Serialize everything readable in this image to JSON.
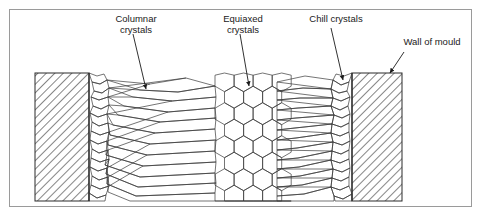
{
  "figure": {
    "background_color": "#ffffff",
    "frame_color": "#9a9a9a",
    "line_color": "#3a3a3a"
  },
  "labels": [
    {
      "id": "columnar",
      "name": "columnar-crystals-label",
      "line1": "Columnar",
      "line2": "crystals",
      "x": 136,
      "y": 22
    },
    {
      "id": "equiaxed",
      "name": "equiaxed-crystals-label",
      "line1": "Equiaxed",
      "line2": "crystals",
      "x": 243,
      "y": 22
    },
    {
      "id": "chill",
      "name": "chill-crystals-label",
      "line1": "Chill crystals",
      "line2": "",
      "x": 336,
      "y": 22
    },
    {
      "id": "wall",
      "name": "wall-of-mould-label",
      "line1": "Wall of mould",
      "line2": "",
      "x": 432,
      "y": 45
    }
  ],
  "leaders": [
    {
      "name": "columnar-leader-arrow",
      "x1": 133,
      "y1": 34,
      "x2": 146,
      "y2": 89
    },
    {
      "name": "equiaxed-leader-arrow",
      "x1": 240,
      "y1": 34,
      "x2": 249,
      "y2": 86
    },
    {
      "name": "chill-leader-arrow",
      "x1": 331,
      "y1": 28,
      "x2": 343,
      "y2": 80
    },
    {
      "name": "wall-leader-arrow",
      "x1": 404,
      "y1": 52,
      "x2": 390,
      "y2": 73
    }
  ],
  "zones": {
    "left_wall": {
      "name": "left-mould-wall",
      "x": 35,
      "y": 73,
      "width": 54,
      "height": 128,
      "hatch": "diagonal-45"
    },
    "right_wall": {
      "name": "right-mould-wall",
      "x": 352,
      "y": 73,
      "width": 50,
      "height": 128,
      "hatch": "diagonal-45"
    },
    "left_chill": {
      "name": "left-chill-zone",
      "x": 89,
      "y": 73,
      "width": 20,
      "height": 128
    },
    "right_chill": {
      "name": "right-chill-zone",
      "x": 332,
      "y": 73,
      "width": 20,
      "height": 128
    },
    "left_columnar": {
      "name": "left-columnar-zone",
      "x": 109,
      "y": 73,
      "width": 106,
      "height": 128
    },
    "right_columnar": {
      "name": "right-columnar-zone",
      "x": 277,
      "y": 73,
      "width": 55,
      "height": 128
    },
    "equiaxed": {
      "name": "equiaxed-zone",
      "x": 215,
      "y": 73,
      "width": 62,
      "height": 128
    }
  },
  "geometry": {
    "casting_top": 73,
    "casting_bottom": 201,
    "hex_radius": 11,
    "hex_rows": 7,
    "hex_cols": 4
  }
}
